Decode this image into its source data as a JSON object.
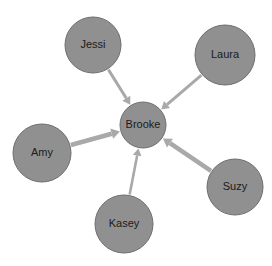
{
  "diagram": {
    "type": "directed-graph",
    "background_color": "#ffffff",
    "node_fill_color": "#909090",
    "node_stroke_color": "#6e6e6e",
    "edge_color": "#a9a9a9",
    "label_color": "#1b1b1b",
    "nodes": [
      {
        "id": "jessi",
        "label": "Jessi",
        "cx": 93,
        "cy": 45,
        "r": 28,
        "font_size": 11
      },
      {
        "id": "laura",
        "label": "Laura",
        "cx": 225,
        "cy": 55,
        "r": 30,
        "font_size": 11
      },
      {
        "id": "brooke",
        "label": "Brooke",
        "cx": 143,
        "cy": 125,
        "r": 23,
        "font_size": 11
      },
      {
        "id": "amy",
        "label": "Amy",
        "cx": 42,
        "cy": 153,
        "r": 29,
        "font_size": 11
      },
      {
        "id": "suzy",
        "label": "Suzy",
        "cx": 235,
        "cy": 187,
        "r": 28,
        "font_size": 11
      },
      {
        "id": "kasey",
        "label": "Kasey",
        "cx": 124,
        "cy": 224,
        "r": 29,
        "font_size": 11
      }
    ],
    "edges": [
      {
        "id": "jessi-brooke",
        "from": "jessi",
        "to": "brooke",
        "width": 3.0,
        "arrow_size": 7.5
      },
      {
        "id": "laura-brooke",
        "from": "laura",
        "to": "brooke",
        "width": 3.0,
        "arrow_size": 7.5
      },
      {
        "id": "amy-brooke",
        "from": "amy",
        "to": "brooke",
        "width": 4.6,
        "arrow_size": 8.5
      },
      {
        "id": "suzy-brooke",
        "from": "suzy",
        "to": "brooke",
        "width": 4.6,
        "arrow_size": 8.5
      },
      {
        "id": "kasey-brooke",
        "from": "kasey",
        "to": "brooke",
        "width": 2.6,
        "arrow_size": 7.0
      }
    ]
  }
}
